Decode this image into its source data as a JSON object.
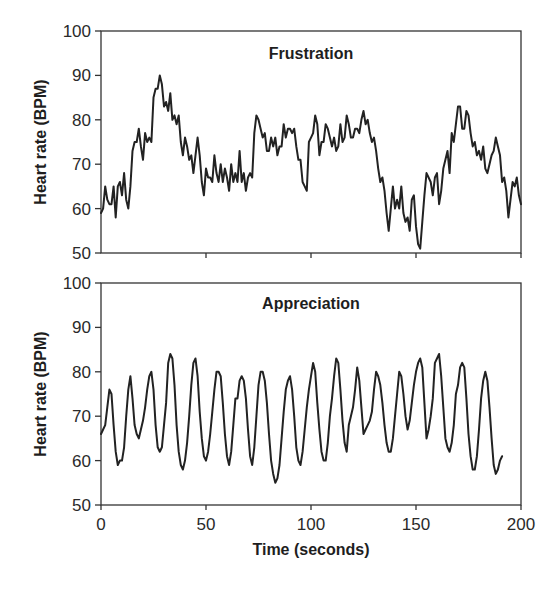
{
  "chart_data": [
    {
      "type": "line",
      "title": "Frustration",
      "xlabel": "",
      "ylabel": "Heart rate (BPM)",
      "xlim": [
        0,
        200
      ],
      "ylim": [
        50,
        100
      ],
      "xticks": [
        0,
        50,
        100,
        150,
        200
      ],
      "yticks": [
        50,
        60,
        70,
        80,
        90,
        100
      ],
      "xtick_labels_visible": false,
      "grid": false,
      "legend": null,
      "series": [
        {
          "name": "Frustration",
          "x": [
            0,
            1,
            2,
            3,
            4,
            5,
            6,
            7,
            8,
            9,
            10,
            11,
            12,
            13,
            14,
            15,
            16,
            17,
            18,
            19,
            20,
            21,
            22,
            23,
            24,
            25,
            26,
            27,
            28,
            29,
            30,
            31,
            32,
            33,
            34,
            35,
            36,
            37,
            38,
            39,
            40,
            41,
            42,
            43,
            44,
            45,
            46,
            47,
            48,
            49,
            50,
            51,
            52,
            53,
            54,
            55,
            56,
            57,
            58,
            59,
            60,
            61,
            62,
            63,
            64,
            65,
            66,
            67,
            68,
            69,
            70,
            71,
            72,
            73,
            74,
            75,
            76,
            77,
            78,
            79,
            80,
            81,
            82,
            83,
            84,
            85,
            86,
            87,
            88,
            89,
            90,
            91,
            92,
            93,
            94,
            95,
            96,
            97,
            98,
            99,
            100,
            101,
            102,
            103,
            104,
            105,
            106,
            107,
            108,
            109,
            110,
            111,
            112,
            113,
            114,
            115,
            116,
            117,
            118,
            119,
            120,
            121,
            122,
            123,
            124,
            125,
            126,
            127,
            128,
            129,
            130,
            131,
            132,
            133,
            134,
            135,
            136,
            137,
            138,
            139,
            140,
            141,
            142,
            143,
            144,
            145,
            146,
            147,
            148,
            149,
            150,
            151,
            152,
            153,
            154,
            155,
            156,
            157,
            158,
            159,
            160,
            161,
            162,
            163,
            164,
            165,
            166,
            167,
            168,
            169,
            170,
            171,
            172,
            173,
            174,
            175,
            176,
            177,
            178,
            179,
            180,
            181,
            182,
            183,
            184,
            185,
            186,
            187,
            188,
            189,
            190,
            191,
            192,
            193,
            194,
            195,
            196,
            197,
            198,
            199,
            200
          ],
          "values": [
            59,
            60,
            65,
            62,
            61,
            61,
            65,
            58,
            65,
            66,
            63,
            68,
            62,
            60,
            65,
            73,
            75,
            75,
            78,
            74,
            71,
            77,
            75,
            76,
            75,
            85,
            87,
            87,
            90,
            88,
            83,
            84,
            82,
            86,
            80,
            81,
            79,
            81,
            75,
            72,
            76,
            74,
            71,
            72,
            68,
            72,
            76,
            72,
            66,
            63,
            69,
            67,
            67,
            66,
            72,
            68,
            66,
            70,
            66,
            69,
            67,
            64,
            70,
            66,
            68,
            66,
            73,
            66,
            68,
            64,
            67,
            68,
            67,
            77,
            81,
            80,
            78,
            76,
            77,
            73,
            73,
            76,
            74,
            76,
            72,
            74,
            74,
            79,
            76,
            78,
            78,
            77,
            78,
            74,
            71,
            71,
            66,
            65,
            64,
            75,
            76,
            77,
            81,
            79,
            72,
            75,
            75,
            79,
            78,
            76,
            74,
            76,
            73,
            74,
            79,
            75,
            76,
            81,
            79,
            76,
            76,
            78,
            78,
            77,
            80,
            82,
            79,
            80,
            77,
            75,
            76,
            73,
            69,
            66,
            67,
            64,
            59,
            55,
            60,
            65,
            60,
            62,
            60,
            65,
            59,
            57,
            58,
            55,
            62,
            63,
            56,
            52,
            51,
            57,
            63,
            68,
            67,
            66,
            63,
            67,
            68,
            61,
            64,
            69,
            71,
            73,
            68,
            77,
            75,
            79,
            83,
            83,
            78,
            78,
            82,
            81,
            77,
            74,
            75,
            72,
            73,
            71,
            74,
            69,
            68,
            70,
            72,
            73,
            76,
            74,
            72,
            66,
            67,
            64,
            58,
            62,
            66,
            65,
            67,
            63,
            61,
            69,
            76,
            62
          ],
          "color": "#222222"
        }
      ]
    },
    {
      "type": "line",
      "title": "Appreciation",
      "xlabel": "Time (seconds)",
      "ylabel": "Heart rate (BPM)",
      "xlim": [
        0,
        200
      ],
      "ylim": [
        50,
        100
      ],
      "xticks": [
        0,
        50,
        100,
        150,
        200
      ],
      "yticks": [
        50,
        60,
        70,
        80,
        90,
        100
      ],
      "grid": false,
      "legend": null,
      "series": [
        {
          "name": "Appreciation",
          "x": [
            0,
            1,
            2,
            3,
            4,
            5,
            6,
            7,
            8,
            9,
            10,
            11,
            12,
            13,
            14,
            15,
            16,
            17,
            18,
            19,
            20,
            21,
            22,
            23,
            24,
            25,
            26,
            27,
            28,
            29,
            30,
            31,
            32,
            33,
            34,
            35,
            36,
            37,
            38,
            39,
            40,
            41,
            42,
            43,
            44,
            45,
            46,
            47,
            48,
            49,
            50,
            51,
            52,
            53,
            54,
            55,
            56,
            57,
            58,
            59,
            60,
            61,
            62,
            63,
            64,
            65,
            66,
            67,
            68,
            69,
            70,
            71,
            72,
            73,
            74,
            75,
            76,
            77,
            78,
            79,
            80,
            81,
            82,
            83,
            84,
            85,
            86,
            87,
            88,
            89,
            90,
            91,
            92,
            93,
            94,
            95,
            96,
            97,
            98,
            99,
            100,
            101,
            102,
            103,
            104,
            105,
            106,
            107,
            108,
            109,
            110,
            111,
            112,
            113,
            114,
            115,
            116,
            117,
            118,
            119,
            120,
            121,
            122,
            123,
            124,
            125,
            126,
            127,
            128,
            129,
            130,
            131,
            132,
            133,
            134,
            135,
            136,
            137,
            138,
            139,
            140,
            141,
            142,
            143,
            144,
            145,
            146,
            147,
            148,
            149,
            150,
            151,
            152,
            153,
            154,
            155,
            156,
            157,
            158,
            159,
            160,
            161,
            162,
            163,
            164,
            165,
            166,
            167,
            168,
            169,
            170,
            171,
            172,
            173,
            174,
            175,
            176,
            177,
            178,
            179,
            180,
            181,
            182,
            183,
            184,
            185,
            186,
            187,
            188,
            189,
            190,
            191,
            192,
            193,
            194,
            195,
            196,
            197,
            198,
            199,
            200
          ],
          "values": [
            66,
            67,
            68,
            72,
            76,
            75,
            68,
            62,
            59,
            60,
            60,
            63,
            70,
            76,
            79,
            74,
            68,
            66,
            65,
            67,
            69,
            72,
            76,
            79,
            80,
            76,
            68,
            63,
            62,
            63,
            68,
            73,
            82,
            84,
            83,
            77,
            68,
            62,
            59,
            58,
            60,
            64,
            70,
            77,
            82,
            83,
            79,
            71,
            65,
            61,
            60,
            62,
            66,
            71,
            76,
            80,
            80,
            79,
            73,
            66,
            61,
            59,
            62,
            68,
            74,
            74,
            78,
            79,
            78,
            74,
            67,
            61,
            59,
            63,
            70,
            77,
            80,
            80,
            78,
            73,
            66,
            60,
            57,
            55,
            56,
            59,
            65,
            71,
            76,
            78,
            79,
            76,
            70,
            63,
            60,
            59,
            62,
            67,
            72,
            76,
            79,
            82,
            80,
            73,
            67,
            62,
            60,
            60,
            64,
            70,
            74,
            79,
            83,
            82,
            76,
            69,
            64,
            62,
            68,
            70,
            72,
            76,
            81,
            78,
            72,
            66,
            67,
            68,
            69,
            71,
            76,
            80,
            79,
            77,
            73,
            68,
            64,
            62,
            62,
            65,
            70,
            75,
            80,
            79,
            75,
            70,
            67,
            69,
            73,
            77,
            80,
            82,
            83,
            81,
            73,
            65,
            67,
            70,
            74,
            82,
            83,
            84,
            79,
            72,
            65,
            63,
            62,
            64,
            68,
            75,
            77,
            81,
            82,
            81,
            74,
            66,
            61,
            58,
            58,
            61,
            67,
            74,
            78,
            80,
            78,
            72,
            65,
            59,
            57,
            58,
            60,
            61
          ],
          "color": "#222222"
        }
      ]
    }
  ],
  "panels": {
    "top": {
      "title": "Frustration",
      "ylabel": "Heart rate (BPM)"
    },
    "bottom": {
      "title": "Appreciation",
      "ylabel": "Heart rate (BPM)"
    }
  },
  "axes": {
    "ytick_labels": [
      "100",
      "90",
      "80",
      "70",
      "60",
      "50"
    ],
    "xtick_labels": [
      "0",
      "50",
      "100",
      "150",
      "200"
    ],
    "xlabel": "Time (seconds)"
  }
}
